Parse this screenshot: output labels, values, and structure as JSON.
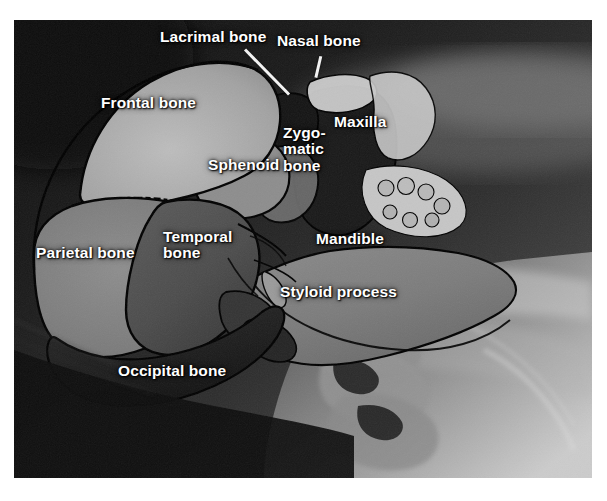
{
  "figure": {
    "kind": "labeled-radiograph",
    "plate": {
      "left": 14,
      "top": 20,
      "width": 578,
      "height": 458,
      "background_color": "#0a0a0a",
      "page_background": "#ffffff"
    }
  },
  "style": {
    "label_color": "#ffffff",
    "outline_color": "#000000",
    "leader_color": "#f2f2f2",
    "bone_light": "#b9b9b9",
    "bone_mid": "#8e8e8e",
    "bone_dark": "#565656",
    "cavity_dark": "#1b1b1b"
  },
  "labels": [
    {
      "id": "lacrimal-bone",
      "text": "Lacrimal bone",
      "x": 160,
      "y": 29,
      "align": "left",
      "leader": {
        "x1": 245,
        "y1": 48,
        "x2": 289,
        "y2": 93
      }
    },
    {
      "id": "nasal-bone",
      "text": "Nasal bone",
      "x": 277,
      "y": 33,
      "align": "left",
      "leader": {
        "x1": 322,
        "y1": 55,
        "x2": 317,
        "y2": 76
      }
    },
    {
      "id": "frontal-bone",
      "text": "Frontal bone",
      "x": 101,
      "y": 95,
      "align": "left",
      "leader": null
    },
    {
      "id": "maxilla",
      "text": "Maxilla",
      "x": 334,
      "y": 114,
      "align": "left",
      "leader": null
    },
    {
      "id": "zygomatic-bone",
      "text": "Zygo-\nmatic\nbone",
      "x": 283,
      "y": 125,
      "align": "left",
      "leader": null
    },
    {
      "id": "sphenoid",
      "text": "Sphenoid",
      "x": 208,
      "y": 157,
      "align": "left",
      "leader": null
    },
    {
      "id": "parietal-bone",
      "text": "Parietal bone",
      "x": 36,
      "y": 245,
      "align": "left",
      "leader": null
    },
    {
      "id": "temporal-bone",
      "text": "Temporal\nbone",
      "x": 163,
      "y": 229,
      "align": "left",
      "leader": null
    },
    {
      "id": "mandible",
      "text": "Mandible",
      "x": 316,
      "y": 231,
      "align": "left",
      "leader": null
    },
    {
      "id": "styloid-process",
      "text": "Styloid process",
      "x": 280,
      "y": 284,
      "align": "left",
      "leader": null
    },
    {
      "id": "occipital-bone",
      "text": "Occipital bone",
      "x": 118,
      "y": 363,
      "align": "left",
      "leader": null
    }
  ]
}
